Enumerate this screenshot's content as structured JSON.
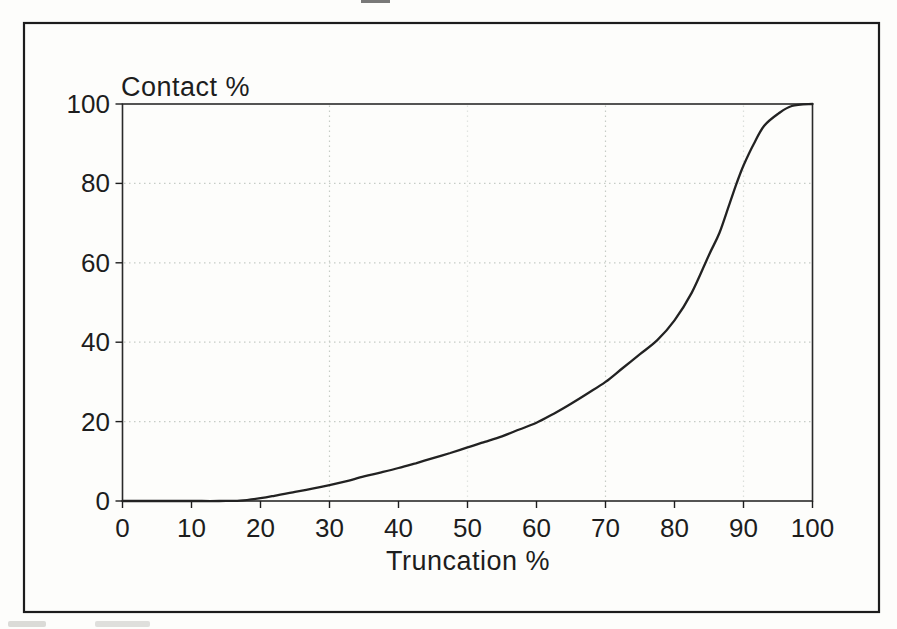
{
  "figure": {
    "y_axis_title": "Contact %",
    "x_axis_label": "Truncation %"
  },
  "chart_data": {
    "type": "line",
    "title": "",
    "xlabel": "Truncation %",
    "ylabel": "Contact %",
    "xlim": [
      0,
      100
    ],
    "ylim": [
      0,
      100
    ],
    "x_ticks": [
      0,
      10,
      20,
      30,
      40,
      50,
      60,
      70,
      80,
      90,
      100
    ],
    "y_ticks": [
      0,
      20,
      40,
      60,
      80,
      100
    ],
    "grid": {
      "style": "dotted",
      "horizontal": [
        20,
        40,
        60,
        80
      ],
      "vertical": [
        30,
        50,
        70,
        90
      ],
      "vertical_opacity": [
        1,
        0.5,
        1,
        0.6
      ]
    },
    "legend": "none",
    "series": [
      {
        "name": "Contact % vs Truncation %",
        "x": [
          0,
          5,
          10,
          14,
          17,
          20,
          22,
          25,
          27.5,
          30,
          32.5,
          35,
          37.5,
          40,
          42.5,
          45,
          47.5,
          50,
          52.5,
          55,
          57.5,
          60,
          62.5,
          65,
          67.5,
          70,
          72.5,
          75,
          77.5,
          80,
          82.5,
          85,
          86.5,
          88,
          89,
          90,
          91.5,
          93,
          95,
          97,
          100
        ],
        "y": [
          0,
          0,
          0,
          0,
          0.1,
          0.7,
          1.3,
          2.3,
          3.1,
          4,
          5,
          6.2,
          7.2,
          8.3,
          9.5,
          10.8,
          12.1,
          13.5,
          14.9,
          16.3,
          18,
          19.7,
          22,
          24.5,
          27.2,
          30,
          33.5,
          37,
          40.5,
          45.5,
          52.5,
          62,
          67.5,
          75,
          80,
          84.5,
          90,
          94.5,
          97.5,
          99.5,
          100
        ]
      }
    ],
    "colors": {
      "line": "#222222",
      "ink": "#1d1d1d",
      "grid": "#c6ccc6",
      "paper": "#fdfdfb"
    }
  }
}
